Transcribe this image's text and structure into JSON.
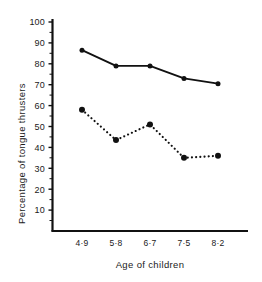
{
  "chart_data": {
    "type": "line",
    "title": "",
    "xlabel": "Age of children",
    "ylabel": "Percentage of tongue thrusters",
    "categories": [
      "4·9",
      "5·8",
      "6·7",
      "7·5",
      "8·2"
    ],
    "ylim": [
      5,
      104
    ],
    "yticks": [
      10,
      20,
      30,
      40,
      50,
      60,
      70,
      80,
      90,
      100
    ],
    "ytick_labels": [
      "10",
      "20",
      "30",
      "40",
      "50",
      "60",
      "70",
      "80",
      "90",
      "100"
    ],
    "grid": false,
    "legend": "none",
    "series": [
      {
        "name": "solid-series",
        "style": "solid",
        "marker": "filled-circle",
        "color": "#111111",
        "values": [
          86.5,
          79,
          79,
          73,
          70.5
        ]
      },
      {
        "name": "dotted-series",
        "style": "dotted",
        "marker": "filled-circle",
        "color": "#111111",
        "values": [
          58,
          43.5,
          51,
          35,
          36
        ]
      }
    ]
  },
  "axes": {
    "y_axis_line_name": "y-axis-spine",
    "x_axis_line_name": "x-axis-spine"
  }
}
